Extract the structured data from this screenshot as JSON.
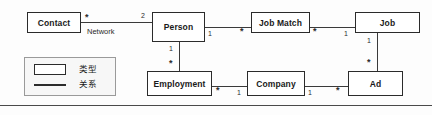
{
  "diagram": {
    "nodes": [
      {
        "id": "contact",
        "label": "Contact",
        "x": 27,
        "y": 12,
        "w": 54,
        "h": 21
      },
      {
        "id": "person",
        "label": "Person",
        "x": 152,
        "y": 12,
        "w": 53,
        "h": 30
      },
      {
        "id": "jobmatch",
        "label": "Job Match",
        "x": 251,
        "y": 12,
        "w": 59,
        "h": 21
      },
      {
        "id": "job",
        "label": "Job",
        "x": 355,
        "y": 12,
        "w": 65,
        "h": 21
      },
      {
        "id": "employment",
        "label": "Employment",
        "x": 147,
        "y": 71,
        "w": 65,
        "h": 25
      },
      {
        "id": "company",
        "label": "Company",
        "x": 247,
        "y": 71,
        "w": 58,
        "h": 25
      },
      {
        "id": "ad",
        "label": "Ad",
        "x": 348,
        "y": 71,
        "w": 55,
        "h": 25
      }
    ],
    "edges": [
      {
        "id": "contact-person",
        "from": "contact",
        "to": "person",
        "orientation": "horizontal",
        "from_mult": "*",
        "to_mult": "2",
        "role": "Network"
      },
      {
        "id": "person-jobmatch",
        "from": "person",
        "to": "jobmatch",
        "orientation": "horizontal",
        "from_mult": "1",
        "to_mult": "*",
        "role": ""
      },
      {
        "id": "jobmatch-job",
        "from": "jobmatch",
        "to": "job",
        "orientation": "horizontal",
        "from_mult": "*",
        "to_mult": "1",
        "role": ""
      },
      {
        "id": "person-employment",
        "from": "person",
        "to": "employment",
        "orientation": "vertical",
        "from_mult": "1",
        "to_mult": "*",
        "role": ""
      },
      {
        "id": "employment-company",
        "from": "employment",
        "to": "company",
        "orientation": "horizontal",
        "from_mult": "*",
        "to_mult": "1",
        "role": ""
      },
      {
        "id": "company-ad",
        "from": "company",
        "to": "ad",
        "orientation": "horizontal",
        "from_mult": "1",
        "to_mult": "*",
        "role": ""
      },
      {
        "id": "job-ad",
        "from": "job",
        "to": "ad",
        "orientation": "vertical",
        "from_mult": "1",
        "to_mult": "*",
        "role": ""
      }
    ]
  },
  "legend": {
    "rows": [
      {
        "symbol": "rectangle",
        "label": "类型"
      },
      {
        "symbol": "line",
        "label": "关系"
      }
    ]
  },
  "colors": {
    "node_border": "#2b2b2b",
    "node_fill": "#ffffff",
    "edge": "#3a3a3a",
    "legend_bg": "#f7f7f7",
    "legend_border": "#9a9a9a",
    "rule": "#4a4a4a"
  }
}
